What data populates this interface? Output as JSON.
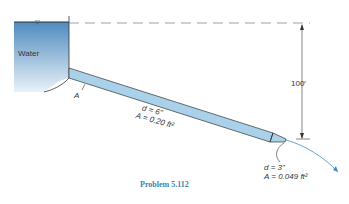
{
  "diagram": {
    "reservoir_label": "Water",
    "free_surface_symbol": "▽",
    "entrance_label": "A",
    "pipe": {
      "diameter_label": "d = 6\"",
      "area_label": "A = 0.20 ft²"
    },
    "nozzle": {
      "diameter_label": "d = 3\"",
      "area_label": "A = 0.049 ft²"
    },
    "elevation_label": "100′",
    "caption": "Problem 5.112",
    "colors": {
      "water_top": "#4f8bbf",
      "water_bottom": "#eaf2f8",
      "pipe_fill": "#a9d2ea",
      "outline": "#333333",
      "caption": "#3f7fa8"
    }
  }
}
